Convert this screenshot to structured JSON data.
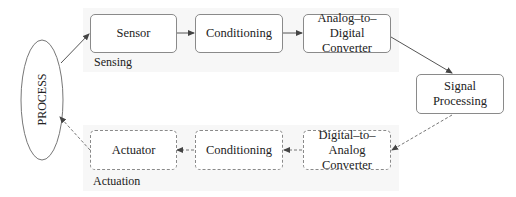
{
  "diagram": {
    "process": {
      "label": "PROCESS"
    },
    "sensing": {
      "group_label": "Sensing",
      "blocks": [
        {
          "label": "Sensor"
        },
        {
          "label": "Conditioning"
        },
        {
          "label": "Analog–to–Digital\nConverter"
        }
      ]
    },
    "signal_processing": {
      "label": "Signal\nProcessing"
    },
    "actuation": {
      "group_label": "Actuation",
      "blocks": [
        {
          "label": "Actuator"
        },
        {
          "label": "Conditioning"
        },
        {
          "label": "Digital–to–Analog\nConverter"
        }
      ]
    },
    "edges": [
      {
        "from": "PROCESS",
        "to": "Sensor",
        "style": "solid"
      },
      {
        "from": "Sensor",
        "to": "Conditioning",
        "style": "solid"
      },
      {
        "from": "Conditioning",
        "to": "Analog–to–Digital Converter",
        "style": "solid"
      },
      {
        "from": "Analog–to–Digital Converter",
        "to": "Signal Processing",
        "style": "solid"
      },
      {
        "from": "Signal Processing",
        "to": "Digital–to–Analog Converter",
        "style": "dashed"
      },
      {
        "from": "Digital–to–Analog Converter",
        "to": "Conditioning",
        "style": "dashed"
      },
      {
        "from": "Conditioning",
        "to": "Actuator",
        "style": "dashed"
      },
      {
        "from": "Actuator",
        "to": "PROCESS",
        "style": "dashed"
      }
    ],
    "colors": {
      "band": "#f7f7f7",
      "border": "#8a8a8a",
      "line": "#555555"
    }
  }
}
